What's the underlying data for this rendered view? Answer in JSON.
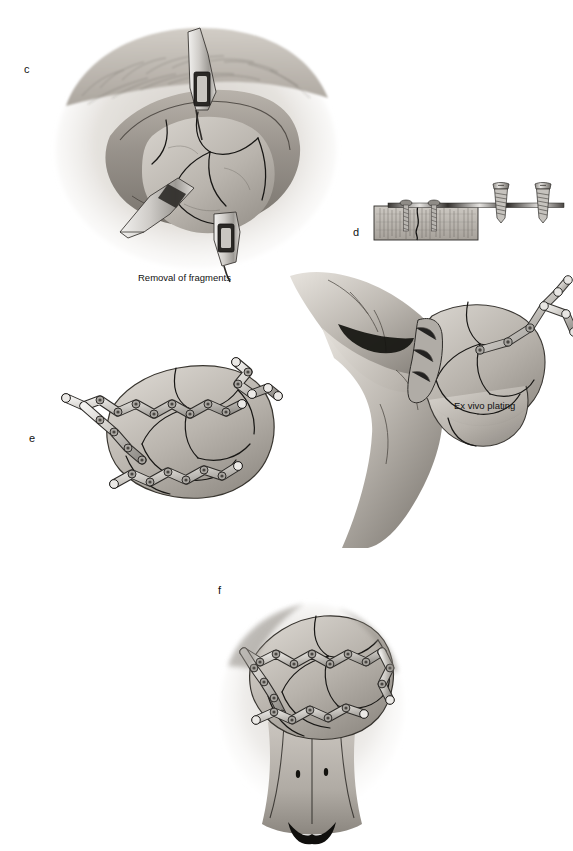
{
  "figure": {
    "background_color": "#ffffff",
    "style": "grayscale medical line-and-wash illustration",
    "panel_letters": {
      "c": "c",
      "d": "d",
      "e": "e",
      "f": "f"
    },
    "captions": {
      "removal": "Removal of fragments",
      "ex_vivo": "Ex vivo plating"
    }
  },
  "panels": [
    {
      "id": "c",
      "letter": "c",
      "caption": "Removal of fragments",
      "description": "Intraoperative view of surgical field with soft-tissue flap retracted, exposing comminuted bone fragments; two retractors and an elevator in place",
      "elements": [
        "soft-tissue-flap",
        "retractor-superior",
        "retractor-inferior",
        "bone-elevator",
        "comminuted-bone-fragments",
        "fracture-lines"
      ]
    },
    {
      "id": "d",
      "letter": "d",
      "caption": "Ex vivo plating",
      "description": "Gloved hand holding reassembled bone fragments with a Y-shaped titanium plate fixed by screws; inset cross-section shows plate seated on bone with two inserted screws and two loose screws above",
      "elements": [
        "gloved-hand",
        "bone-fragments",
        "y-shaped-plate",
        "bone-cross-section-inset",
        "inserted-screws",
        "loose-screws"
      ],
      "inset": {
        "name": "bone-cross-section",
        "inserted_screw_count": 2,
        "loose_screw_count": 2
      }
    },
    {
      "id": "e",
      "letter": "e",
      "description": "Reassembled bone fragment construct viewed en face, stabilised by three scalloped mesh plates secured with screws",
      "elements": [
        "bone-fragments",
        "mesh-plate-upper",
        "mesh-plate-middle",
        "mesh-plate-lower",
        "screws"
      ],
      "plate_count": 3
    },
    {
      "id": "f",
      "letter": "f",
      "description": "Plated bone construct reimplanted in situ in the anterior midline anatomy, with plates and screws spanning the fracture lines",
      "elements": [
        "surrounding-soft-tissue",
        "reimplanted-bone-construct",
        "mesh-plate-upper",
        "mesh-plate-lower",
        "screws",
        "midline-structures"
      ]
    }
  ],
  "colors": {
    "ink": "#1a1a1a",
    "bone_light": "#d2cfc9",
    "bone_mid": "#b3afa8",
    "bone_dark": "#8e8a83",
    "tissue_light": "#ded9d3",
    "tissue_mid": "#b8b2aa",
    "tissue_dark": "#6f6a64",
    "metal_light": "#eceae7",
    "metal_mid": "#bcb9b4",
    "metal_dark": "#7d7a75",
    "background": "#ffffff"
  }
}
